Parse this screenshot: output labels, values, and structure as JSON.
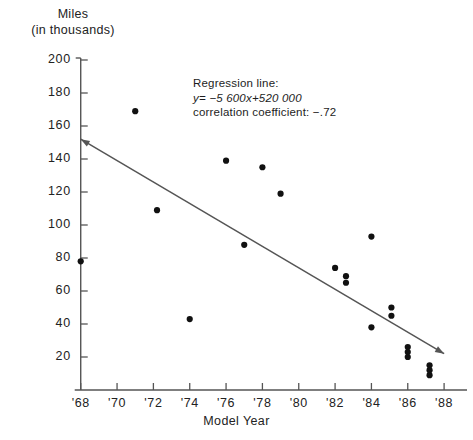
{
  "chart_data": {
    "type": "scatter",
    "title": "",
    "ylabel_line1": "Miles",
    "ylabel_line2": "(in thousands)",
    "xlabel": "Model Year",
    "xlim": [
      67.3,
      88.6
    ],
    "ylim": [
      0,
      200
    ],
    "grid": false,
    "legend": "none",
    "x_tick_labels": [
      "'68",
      "'70",
      "'72",
      "'74",
      "'76",
      "'78",
      "'80",
      "'82",
      "'84",
      "'86",
      "'88"
    ],
    "x_tick_values": [
      68,
      70,
      72,
      74,
      76,
      78,
      80,
      82,
      84,
      86,
      88
    ],
    "y_tick_labels": [
      "200",
      "180",
      "160",
      "140",
      "120",
      "100",
      "80",
      "60",
      "40",
      "20"
    ],
    "y_tick_values": [
      200,
      180,
      160,
      140,
      120,
      100,
      80,
      60,
      40,
      20
    ],
    "points": [
      {
        "x": 68.0,
        "y": 78
      },
      {
        "x": 71.0,
        "y": 169
      },
      {
        "x": 72.2,
        "y": 109
      },
      {
        "x": 74.0,
        "y": 43
      },
      {
        "x": 76.0,
        "y": 139
      },
      {
        "x": 77.0,
        "y": 88
      },
      {
        "x": 78.0,
        "y": 135
      },
      {
        "x": 79.0,
        "y": 119
      },
      {
        "x": 82.0,
        "y": 74
      },
      {
        "x": 82.6,
        "y": 69
      },
      {
        "x": 82.6,
        "y": 65
      },
      {
        "x": 84.0,
        "y": 93
      },
      {
        "x": 84.0,
        "y": 38
      },
      {
        "x": 85.1,
        "y": 50
      },
      {
        "x": 85.1,
        "y": 45
      },
      {
        "x": 86.0,
        "y": 26
      },
      {
        "x": 86.0,
        "y": 23
      },
      {
        "x": 86.0,
        "y": 20
      },
      {
        "x": 87.2,
        "y": 15
      },
      {
        "x": 87.2,
        "y": 12
      },
      {
        "x": 87.2,
        "y": 9
      }
    ],
    "regression_line": {
      "label": "Regression line:",
      "equation": "y= −5 600x+520 000",
      "correlation_text": "correlation coefficient:  −.72",
      "slope": -5600,
      "intercept": 520000,
      "correlation_coefficient": -0.72,
      "endpoint_start": {
        "x": 68.0,
        "y": 152
      },
      "endpoint_end": {
        "x": 88.0,
        "y": 22
      }
    },
    "colors": {
      "marker": "#111111",
      "line": "#555555",
      "axis": "#555555",
      "text": "#1d1d1d",
      "background": "#ffffff"
    }
  }
}
